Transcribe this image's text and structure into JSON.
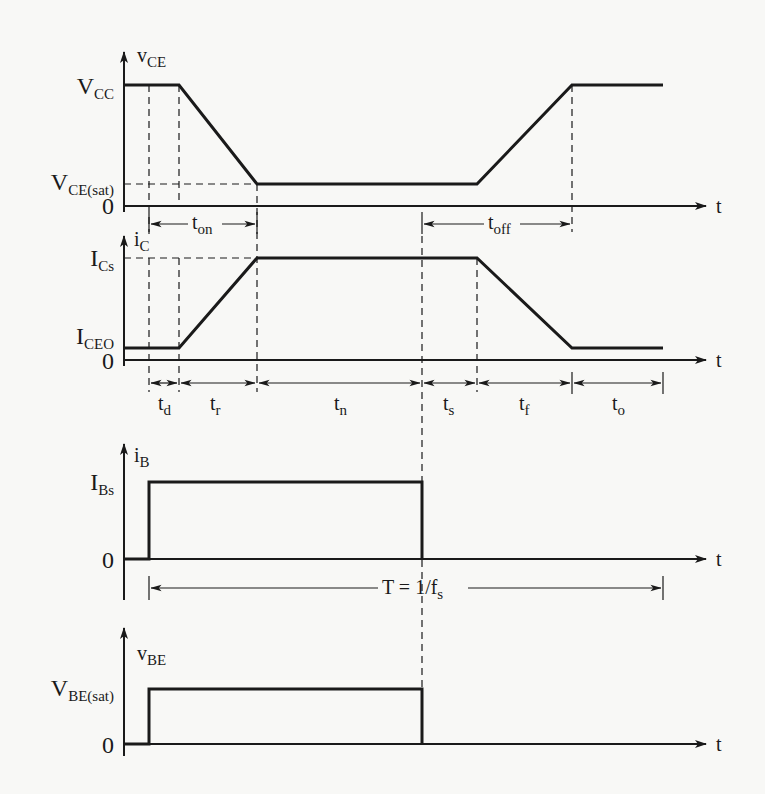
{
  "figure": {
    "type": "BJT switching waveforms",
    "plots": [
      {
        "id": "vce",
        "axis_label": "v",
        "axis_label_sub": "CE",
        "levels": [
          {
            "label": "V",
            "sub": "CC"
          },
          {
            "label": "V",
            "sub": "CE(sat)"
          },
          {
            "label": "0",
            "sub": ""
          }
        ],
        "time_label": "t"
      },
      {
        "id": "ic",
        "axis_label": "i",
        "axis_label_sub": "C",
        "levels": [
          {
            "label": "I",
            "sub": "Cs"
          },
          {
            "label": "I",
            "sub": "CEO"
          },
          {
            "label": "0",
            "sub": ""
          }
        ],
        "time_label": "t"
      },
      {
        "id": "ib",
        "axis_label": "i",
        "axis_label_sub": "B",
        "levels": [
          {
            "label": "I",
            "sub": "Bs"
          },
          {
            "label": "0",
            "sub": ""
          }
        ],
        "time_label": "t"
      },
      {
        "id": "vbe",
        "axis_label": "v",
        "axis_label_sub": "BE",
        "levels": [
          {
            "label": "V",
            "sub": "BE(sat)"
          },
          {
            "label": "0",
            "sub": ""
          }
        ],
        "time_label": "t"
      }
    ],
    "intervals_top": [
      {
        "label": "t",
        "sub": "on"
      },
      {
        "label": "t",
        "sub": "off"
      }
    ],
    "intervals": [
      {
        "label": "t",
        "sub": "d"
      },
      {
        "label": "t",
        "sub": "r"
      },
      {
        "label": "t",
        "sub": "n"
      },
      {
        "label": "t",
        "sub": "s"
      },
      {
        "label": "t",
        "sub": "f"
      },
      {
        "label": "t",
        "sub": "o"
      }
    ],
    "period": {
      "label": "T = 1/f",
      "sub": "s"
    }
  }
}
